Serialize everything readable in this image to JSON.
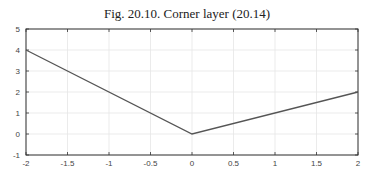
{
  "title": "Fig. 20.10.  Corner layer (20.14)",
  "chart_data": {
    "type": "line",
    "title": "Fig. 20.10.  Corner layer (20.14)",
    "xlabel": "",
    "ylabel": "",
    "xlim": [
      -2,
      2
    ],
    "ylim": [
      -1,
      5
    ],
    "xticks": [
      "-2",
      "-1.5",
      "-1",
      "-0.5",
      "0",
      "0.5",
      "1",
      "1.5",
      "2"
    ],
    "yticks": [
      "-1",
      "0",
      "1",
      "2",
      "3",
      "4",
      "5"
    ],
    "grid": true,
    "legend": null,
    "series": [
      {
        "name": "corner layer",
        "x": [
          -2,
          0,
          2
        ],
        "y": [
          4,
          0,
          2
        ],
        "color": "#555555"
      }
    ]
  }
}
